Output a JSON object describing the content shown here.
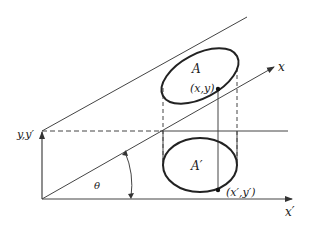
{
  "diagram": {
    "labels": {
      "area_top": "A",
      "point_top": "(x,y)",
      "axis_x": "x",
      "axis_y": "y,y′",
      "angle": "θ",
      "area_bottom": "A′",
      "point_bottom": "(x′,y′)",
      "axis_x_prime": "x′"
    },
    "colors": {
      "stroke": "#333333",
      "background": "#ffffff"
    }
  }
}
